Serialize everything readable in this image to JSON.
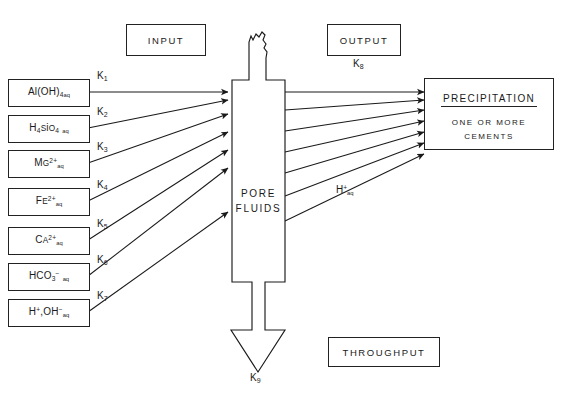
{
  "page": {
    "header_running_title": "",
    "page_number": ""
  },
  "figure": {
    "process_label": "PORE\nFLUIDS",
    "process_line1": "PORE",
    "process_line2": "FLUIDS",
    "input_label": "INPUT",
    "output_label": "OUTPUT",
    "throughput_label": "THROUGHPUT",
    "output_rate": "K",
    "output_rate_sub": "8",
    "throughput_rate": "K",
    "throughput_rate_sub": "9",
    "proton_label_base": "H",
    "proton_label_sup": "+",
    "proton_label_sub": "aq"
  },
  "precipitation": {
    "title": "PRECIPITATION",
    "line1": "ONE   OR  MORE",
    "line2": "CEMENTS"
  },
  "inputs": [
    {
      "id": "al-hydroxide",
      "formula_html": "Al(OH)<sub>4</sub><span class=\"aq\">aq</span>",
      "rate": "K",
      "rate_sub": "1"
    },
    {
      "id": "silicic-acid",
      "formula_html": "H<sub>4</sub><span class=\"sc\">S</span>i<span class=\"sc\">O</span><sub>4</sub> <span class=\"aq\">aq</span>",
      "rate": "K",
      "rate_sub": "2"
    },
    {
      "id": "magnesium",
      "formula_html": "M<span class=\"sc\">G</span><sup>2+</sup><span class=\"aq\">aq</span>",
      "rate": "K",
      "rate_sub": "3"
    },
    {
      "id": "iron-two",
      "formula_html": "F<span class=\"sc\">E</span><sup>2+</sup><span class=\"aq\">aq</span>",
      "rate": "K",
      "rate_sub": "4"
    },
    {
      "id": "calcium",
      "formula_html": "C<span class=\"sc\">A</span><sup>2+</sup><span class=\"aq\">aq</span>",
      "rate": "K",
      "rate_sub": "5"
    },
    {
      "id": "bicarbonate",
      "formula_html": "HCO<sub>3</sub><sup>&#8722;</sup> <span class=\"aq\">aq</span>",
      "rate": "K",
      "rate_sub": "6"
    },
    {
      "id": "proton-hydroxide",
      "formula_html": "H<sup>+</sup>,OH<sup>&#8722;</sup><span class=\"aq\">aq</span>",
      "rate": "K",
      "rate_sub": "7"
    }
  ],
  "colors": {
    "ink": "#1a1a1a",
    "stroke": "#222222",
    "paper": "#ffffff"
  },
  "chart_data": {
    "type": "diagram",
    "nodes": [
      {
        "name": "Al(OH)4 aq",
        "role": "input"
      },
      {
        "name": "H4SiO4 aq",
        "role": "input"
      },
      {
        "name": "Mg2+ aq",
        "role": "input"
      },
      {
        "name": "Fe2+ aq",
        "role": "input"
      },
      {
        "name": "Ca2+ aq",
        "role": "input"
      },
      {
        "name": "HCO3- aq",
        "role": "input"
      },
      {
        "name": "H+,OH- aq",
        "role": "input"
      },
      {
        "name": "PORE FLUIDS",
        "role": "process"
      },
      {
        "name": "PRECIPITATION / ONE OR MORE CEMENTS",
        "role": "output"
      },
      {
        "name": "THROUGHPUT",
        "role": "throughput"
      }
    ],
    "edges": [
      {
        "from": "Al(OH)4 aq",
        "to": "PORE FLUIDS",
        "label": "K1"
      },
      {
        "from": "H4SiO4 aq",
        "to": "PORE FLUIDS",
        "label": "K2"
      },
      {
        "from": "Mg2+ aq",
        "to": "PORE FLUIDS",
        "label": "K3"
      },
      {
        "from": "Fe2+ aq",
        "to": "PORE FLUIDS",
        "label": "K4"
      },
      {
        "from": "Ca2+ aq",
        "to": "PORE FLUIDS",
        "label": "K5"
      },
      {
        "from": "HCO3- aq",
        "to": "PORE FLUIDS",
        "label": "K6"
      },
      {
        "from": "H+,OH- aq",
        "to": "PORE FLUIDS",
        "label": "K7"
      },
      {
        "from": "PORE FLUIDS",
        "to": "PRECIPITATION",
        "label": "K8"
      },
      {
        "from": "PORE FLUIDS",
        "to": "PRECIPITATION",
        "label": "H+aq"
      },
      {
        "from": "PORE FLUIDS",
        "to": "THROUGHPUT",
        "label": "K9"
      }
    ]
  }
}
